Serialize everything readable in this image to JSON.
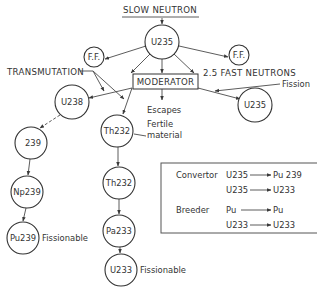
{
  "title": "SLOW NEUTRON",
  "nodes": {
    "u235_top": "U235",
    "ff_left": "F.F.",
    "ff_right": "F.F.",
    "moderator": "MODERATOR",
    "u238": "U238",
    "th232_fertile": "Th232",
    "u235_right": "U235",
    "n239": "239",
    "np239": "Np239",
    "pu239": "Pu239",
    "th232_second": "Th232",
    "pa233": "Pa233",
    "u233": "U233"
  },
  "labels": {
    "transmutation": "TRANSMUTATION",
    "fast_neutrons": "2.5 FAST NEUTRONS",
    "fission": "Fission",
    "escapes": "Escapes",
    "fertile_line1": "Fertile",
    "fertile_line2": "material",
    "pu239_fissionable": "Fissionable",
    "u233_fissionable": "Fissionable"
  },
  "legend": {
    "convertor": {
      "label": "Convertor",
      "rows": [
        {
          "from": "U235",
          "to": "Pu 239"
        },
        {
          "from": "U235",
          "to": "U233"
        }
      ]
    },
    "breeder": {
      "label": "Breeder",
      "rows": [
        {
          "from": "Pu",
          "to": "Pu"
        },
        {
          "from": "U233",
          "to": "U233"
        }
      ]
    }
  },
  "colors": {
    "line": "#4a4a4a",
    "text": "#333333",
    "background": "#ffffff"
  }
}
